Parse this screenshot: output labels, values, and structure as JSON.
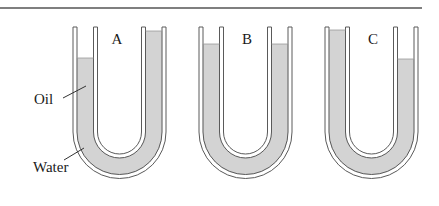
{
  "diagram": {
    "colors": {
      "rule": "#555555",
      "wall": "#5a5a5a",
      "liquid": "#d3d3d3",
      "text": "#1a1a1a",
      "background": "#ffffff"
    },
    "tubes": [
      {
        "id": "A",
        "label": "A",
        "left_level_y": 58,
        "right_level_y": 31
      },
      {
        "id": "B",
        "label": "B",
        "left_level_y": 44,
        "right_level_y": 44
      },
      {
        "id": "C",
        "label": "C",
        "left_level_y": 30,
        "right_level_y": 59
      }
    ],
    "labels": {
      "oil": "Oil",
      "water": "Water"
    }
  }
}
